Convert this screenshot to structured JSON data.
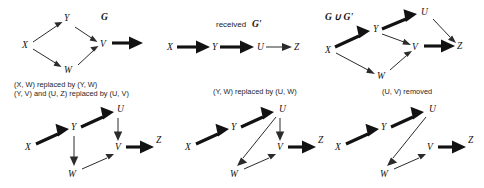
{
  "figure": {
    "width": 484,
    "height": 188,
    "background": "#ffffff",
    "ink_color": "#1a1a1a"
  },
  "node_labels": {
    "X": "X",
    "Y": "Y",
    "W": "W",
    "V": "V",
    "U": "U",
    "Z": "Z"
  },
  "panels": [
    {
      "id": "panel-g",
      "title": "G",
      "title_prefix": "",
      "caption": "",
      "nodes": [
        "X",
        "Y",
        "W",
        "V"
      ],
      "edges": [
        {
          "from": "X",
          "to": "Y",
          "weight": "thin"
        },
        {
          "from": "X",
          "to": "W",
          "weight": "thin"
        },
        {
          "from": "Y",
          "to": "V",
          "weight": "thin"
        },
        {
          "from": "W",
          "to": "V",
          "weight": "thin"
        },
        {
          "from": "V",
          "to": "",
          "weight": "thick"
        }
      ]
    },
    {
      "id": "panel-g-prime",
      "title": "G'",
      "title_prefix": "received ",
      "caption": "",
      "nodes": [
        "X",
        "Y",
        "U",
        "Z"
      ],
      "edges": [
        {
          "from": "X",
          "to": "Y",
          "weight": "thick"
        },
        {
          "from": "Y",
          "to": "U",
          "weight": "thick"
        },
        {
          "from": "U",
          "to": "Z",
          "weight": "thin"
        }
      ]
    },
    {
      "id": "panel-union",
      "title": "G ∪ G'",
      "title_prefix": "",
      "caption": "",
      "nodes": [
        "X",
        "Y",
        "W",
        "V",
        "U",
        "Z"
      ],
      "edges": [
        {
          "from": "X",
          "to": "Y",
          "weight": "thick"
        },
        {
          "from": "X",
          "to": "W",
          "weight": "thin"
        },
        {
          "from": "Y",
          "to": "U",
          "weight": "thick"
        },
        {
          "from": "Y",
          "to": "V",
          "weight": "thin"
        },
        {
          "from": "W",
          "to": "V",
          "weight": "thin"
        },
        {
          "from": "U",
          "to": "Z",
          "weight": "thin"
        },
        {
          "from": "V",
          "to": "Z",
          "weight": "thick"
        }
      ]
    },
    {
      "id": "panel-step1",
      "title": "",
      "title_prefix": "",
      "caption_lines": [
        "(X, W) replaced by (Y, W)",
        "(Y, V) and (U, Z) replaced by (U, V)"
      ],
      "nodes": [
        "X",
        "Y",
        "U",
        "V",
        "W",
        "Z"
      ],
      "edges": [
        {
          "from": "X",
          "to": "Y",
          "weight": "thick"
        },
        {
          "from": "Y",
          "to": "U",
          "weight": "thick"
        },
        {
          "from": "Y",
          "to": "W",
          "weight": "thin"
        },
        {
          "from": "U",
          "to": "V",
          "weight": "thin"
        },
        {
          "from": "W",
          "to": "V",
          "weight": "thin"
        },
        {
          "from": "V",
          "to": "Z",
          "weight": "thick"
        }
      ]
    },
    {
      "id": "panel-step2",
      "title": "",
      "title_prefix": "",
      "caption_lines": [
        "(Y, W) replaced by (U, W)"
      ],
      "nodes": [
        "X",
        "Y",
        "U",
        "V",
        "W",
        "Z"
      ],
      "edges": [
        {
          "from": "X",
          "to": "Y",
          "weight": "thick"
        },
        {
          "from": "Y",
          "to": "U",
          "weight": "thick"
        },
        {
          "from": "U",
          "to": "W",
          "weight": "thin"
        },
        {
          "from": "U",
          "to": "V",
          "weight": "thin"
        },
        {
          "from": "W",
          "to": "V",
          "weight": "thin"
        },
        {
          "from": "V",
          "to": "Z",
          "weight": "thick"
        }
      ]
    },
    {
      "id": "panel-step3",
      "title": "",
      "title_prefix": "",
      "caption_lines": [
        "(U, V) removed"
      ],
      "nodes": [
        "X",
        "Y",
        "U",
        "V",
        "W",
        "Z"
      ],
      "edges": [
        {
          "from": "X",
          "to": "Y",
          "weight": "thick"
        },
        {
          "from": "Y",
          "to": "U",
          "weight": "thick"
        },
        {
          "from": "U",
          "to": "W",
          "weight": "thin"
        },
        {
          "from": "W",
          "to": "V",
          "weight": "thin"
        },
        {
          "from": "V",
          "to": "Z",
          "weight": "thick"
        }
      ]
    }
  ],
  "captions": {
    "step1_line1": "(X, W) replaced by (Y, W)",
    "step1_line2": "(Y, V) and (U, Z) replaced by (U, V)",
    "step2": "(Y, W) replaced by (U, W)",
    "step3": "(U, V) removed"
  },
  "titles": {
    "g": "G",
    "received_prefix": "received",
    "g_prime": "G'",
    "union": "G ∪ G'"
  }
}
